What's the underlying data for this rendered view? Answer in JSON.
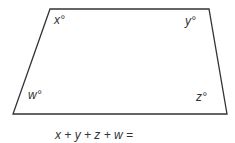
{
  "diagram": {
    "type": "quadrilateral",
    "shape": "trapezoid",
    "stroke_color": "#333333",
    "vertices": [
      {
        "corner": "top-left",
        "x": 50,
        "y": 9
      },
      {
        "corner": "top-right",
        "x": 209,
        "y": 9
      },
      {
        "corner": "bottom-right",
        "x": 227,
        "y": 114
      },
      {
        "corner": "bottom-left",
        "x": 13,
        "y": 114
      }
    ],
    "angle_labels": {
      "top_left": "x°",
      "top_right": "y°",
      "bottom_right": "z°",
      "bottom_left": "w°"
    }
  },
  "question": {
    "equation": "x + y + z + w ="
  }
}
